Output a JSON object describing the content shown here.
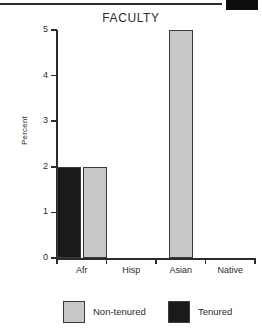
{
  "decoration": {
    "top_rule": "horizontal-rule",
    "top_block": "black-block"
  },
  "chart_data": {
    "type": "bar",
    "title": "FACULTY",
    "xlabel": "",
    "ylabel": "Percent",
    "categories": [
      "Afr",
      "Hisp",
      "Asian",
      "Native"
    ],
    "series": [
      {
        "name": "Non-tenured",
        "color": "#c8c8c8",
        "values": [
          2,
          0,
          5,
          0
        ]
      },
      {
        "name": "Tenured",
        "color": "#1a1a1a",
        "values": [
          2,
          0,
          0,
          0
        ]
      }
    ],
    "ylim": [
      0,
      5
    ],
    "yticks": [
      0,
      1,
      2,
      3,
      4,
      5
    ],
    "ytick_labels": [
      "0",
      "1",
      "2",
      "3",
      "4",
      "5"
    ],
    "grid": false,
    "legend_position": "bottom",
    "legend": [
      "Non-tenured",
      "Tenured"
    ]
  }
}
